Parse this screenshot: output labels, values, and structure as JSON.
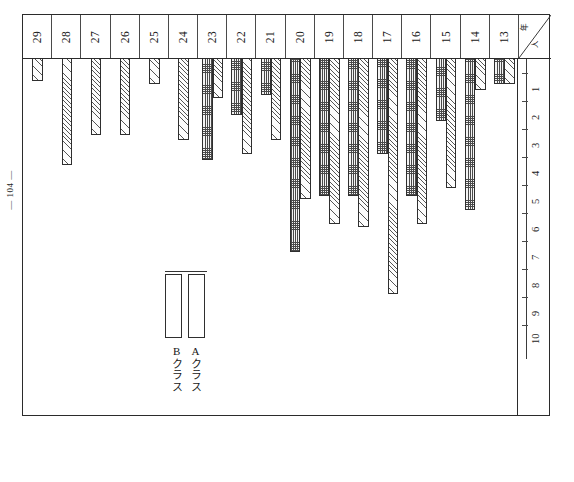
{
  "page": {
    "folio": "— 104 —"
  },
  "chart_header": {
    "corner_top_label": "年",
    "corner_bottom_label": "人"
  },
  "legend": {
    "series_a_label": "Aクラス",
    "series_b_label": "Bクラス"
  },
  "chart_data": {
    "type": "bar",
    "title": "",
    "subtitle": "",
    "xlabel": "",
    "ylabel": "",
    "orientation": "downward",
    "grid": false,
    "legend_position": "inside-left",
    "ylim": [
      0,
      10
    ],
    "yticks": [
      1,
      2,
      3,
      4,
      5,
      6,
      7,
      8,
      9,
      10
    ],
    "ytick_labels": [
      "1",
      "2",
      "3",
      "4",
      "5",
      "6",
      "7",
      "8",
      "9",
      "10"
    ],
    "categories": [
      "29",
      "28",
      "27",
      "26",
      "25",
      "24",
      "23",
      "22",
      "21",
      "20",
      "19",
      "18",
      "17",
      "16",
      "15",
      "14",
      "13"
    ],
    "series": [
      {
        "name": "Bクラス",
        "pattern": "cross-hatch",
        "values": [
          null,
          null,
          null,
          null,
          null,
          null,
          3.6,
          2.0,
          1.3,
          6.9,
          4.9,
          4.9,
          3.4,
          4.9,
          2.2,
          5.4,
          0.9
        ]
      },
      {
        "name": "Aクラス",
        "pattern": "diagonal-hatch",
        "values": [
          0.8,
          3.8,
          2.7,
          2.7,
          0.9,
          2.9,
          1.4,
          3.4,
          2.9,
          5.0,
          5.9,
          6.0,
          8.4,
          5.9,
          4.6,
          1.1,
          0.9
        ]
      }
    ]
  }
}
